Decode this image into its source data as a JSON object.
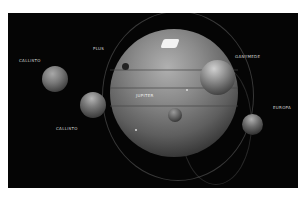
{
  "scene": {
    "description": "Rendered planetary system: large banded gas giant with several orbiting moons on black space background",
    "colors": {
      "background": "#050505",
      "planet": "#8a8a8a",
      "label": "#d8d8d8",
      "frame": "#ffffff"
    }
  },
  "labels": [
    {
      "id": "upper-left",
      "text": "CALLISTO"
    },
    {
      "id": "top",
      "text": "PLUS"
    },
    {
      "id": "right-upper",
      "text": "GANYMEDE"
    },
    {
      "id": "right",
      "text": "EUROPA"
    },
    {
      "id": "lower-left",
      "text": "CALLISTO"
    },
    {
      "id": "center",
      "text": "JUPITER"
    }
  ]
}
